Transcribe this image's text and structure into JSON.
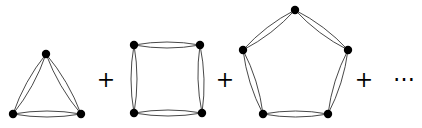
{
  "diagram": {
    "cut_off_text_line": "",
    "terms": [
      {
        "name": "triangle",
        "vertices": [
          [
            46,
            54
          ],
          [
            13,
            114
          ],
          [
            81,
            114
          ]
        ]
      },
      {
        "name": "square",
        "vertices": [
          [
            134,
            45
          ],
          [
            200,
            45
          ],
          [
            202,
            113
          ],
          [
            134,
            113
          ]
        ]
      },
      {
        "name": "pentagon",
        "vertices": [
          [
            295,
            10
          ],
          [
            348,
            50
          ],
          [
            328,
            114
          ],
          [
            263,
            114
          ],
          [
            243,
            50
          ]
        ]
      }
    ],
    "operators": [
      {
        "symbol": "+",
        "x": 106,
        "y": 80
      },
      {
        "symbol": "+",
        "x": 225,
        "y": 80
      },
      {
        "symbol": "+",
        "x": 364,
        "y": 80
      }
    ],
    "ellipsis": "⋯",
    "colors": {
      "stroke": "#333333",
      "vertex": "#000000",
      "background": "#ffffff"
    }
  }
}
